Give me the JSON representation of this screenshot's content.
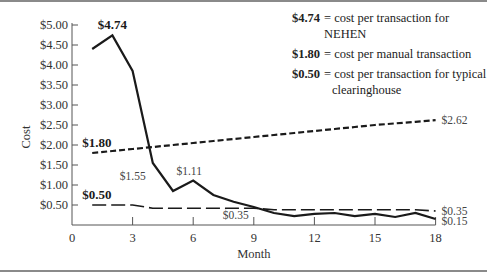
{
  "chart_data": {
    "type": "line",
    "title": "",
    "xlabel": "Month",
    "ylabel": "Cost",
    "xlim": [
      0,
      18
    ],
    "ylim": [
      0,
      5.0
    ],
    "x_ticks": [
      "0",
      "3",
      "6",
      "9",
      "12",
      "15",
      "18"
    ],
    "y_ticks": [
      "$0.50",
      "$1.00",
      "$1.50",
      "$2.00",
      "$2.50",
      "$3.00",
      "$3.50",
      "$4.00",
      "$4.50",
      "$5.00"
    ],
    "grid": false,
    "legend_position": "top-right",
    "x": [
      1,
      2,
      3,
      4,
      5,
      6,
      7,
      8,
      9,
      10,
      11,
      12,
      13,
      14,
      15,
      16,
      17,
      18
    ],
    "series": [
      {
        "name": "NEHEN",
        "style": "solid",
        "values": [
          4.4,
          4.74,
          3.85,
          1.55,
          0.85,
          1.11,
          0.75,
          0.58,
          0.45,
          0.3,
          0.22,
          0.28,
          0.3,
          0.22,
          0.28,
          0.2,
          0.3,
          0.15
        ]
      },
      {
        "name": "Manual",
        "style": "short-dash",
        "values": [
          1.8,
          1.85,
          1.9,
          1.95,
          2.0,
          2.05,
          2.1,
          2.15,
          2.2,
          2.25,
          2.3,
          2.35,
          2.4,
          2.45,
          2.5,
          2.54,
          2.58,
          2.62
        ]
      },
      {
        "name": "Typical clearinghouse",
        "style": "long-dash",
        "values": [
          0.5,
          0.5,
          0.5,
          0.42,
          0.42,
          0.42,
          0.42,
          0.42,
          0.42,
          0.38,
          0.38,
          0.38,
          0.38,
          0.38,
          0.38,
          0.38,
          0.38,
          0.35
        ]
      }
    ],
    "annotations": [
      {
        "text": "$4.74",
        "x": 2,
        "y": 4.74,
        "bold": true
      },
      {
        "text": "$1.80",
        "x": 1,
        "y": 1.8,
        "bold": true
      },
      {
        "text": "$0.50",
        "x": 1,
        "y": 0.5,
        "bold": true
      },
      {
        "text": "$1.55",
        "x": 4,
        "y": 1.55,
        "bold": false
      },
      {
        "text": "$1.11",
        "x": 6,
        "y": 1.11,
        "bold": false
      },
      {
        "text": "$0.35",
        "x": 9,
        "y": 0.35,
        "bold": false
      },
      {
        "text": "$2.62",
        "x": 18,
        "y": 2.62,
        "bold": false
      },
      {
        "text": "$0.35",
        "x": 18,
        "y": 0.35,
        "bold": false
      },
      {
        "text": "$0.15",
        "x": 18,
        "y": 0.15,
        "bold": false
      }
    ]
  },
  "legend": {
    "items": [
      {
        "key": "$4.74",
        "text": "= cost per transaction for NEHEN"
      },
      {
        "key": "$1.80",
        "text": "= cost per manual transaction"
      },
      {
        "key": "$0.50",
        "text": "= cost per transaction for typical clearinghouse"
      }
    ]
  },
  "axes": {
    "xlabel": "Month",
    "ylabel": "Cost"
  }
}
